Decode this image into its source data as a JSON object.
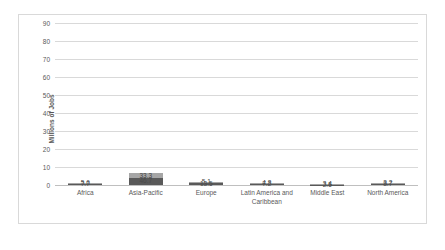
{
  "chart_data": {
    "type": "bar",
    "subtype": "stacked-bar",
    "title": "",
    "subtitle": "",
    "xlabel": "",
    "ylabel": "Millions of Jobs",
    "ylim": [
      0,
      90
    ],
    "ytick_step": 10,
    "yticks": [
      "0",
      "10",
      "20",
      "30",
      "40",
      "50",
      "60",
      "70",
      "80",
      "90"
    ],
    "grid": "horizontal",
    "legend": "none",
    "categories": [
      "Africa",
      "Asia-Pacific",
      "Europe",
      "Latin America and Caribbean",
      "Middle East",
      "North America"
    ],
    "series": [
      {
        "name": "lower",
        "color": "#595959",
        "values": [
          7.7,
          46.7,
          13.5,
          7.2,
          2.5,
          8.7
        ],
        "labels": [
          "7.7",
          "46.7",
          "13.5",
          "7.2",
          "2.5",
          "8.7"
        ]
      },
      {
        "name": "upper",
        "color": "#a6a6a6",
        "values": [
          5.6,
          33.3,
          5.1,
          4.8,
          3.4,
          3.2
        ],
        "labels": [
          "5.6",
          "33.3",
          "5.1",
          "4.8",
          "3.4",
          "3.2"
        ]
      }
    ],
    "totals": [
      13.3,
      80.0,
      18.6,
      12.0,
      5.9,
      11.9
    ]
  },
  "colors": {
    "series_lower": "#595959",
    "series_upper": "#a6a6a6",
    "gridline": "#d9d9d9",
    "axis_text": "#595959",
    "frame_border": "#d9d9d9",
    "background": "#ffffff"
  }
}
